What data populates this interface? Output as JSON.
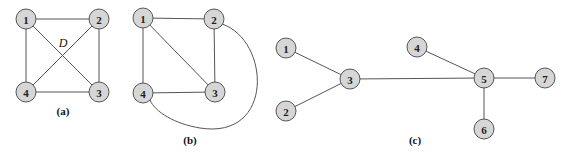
{
  "figure": {
    "node_fill": "#d6d6d6",
    "node_stroke": "#555555",
    "edge_color": "#555555",
    "panels": [
      {
        "id": "a",
        "caption": "(a)",
        "caption_pos": [
          63,
          115
        ],
        "annotation": {
          "text": "D",
          "pos": [
            63,
            47
          ]
        },
        "nodes": [
          {
            "label": "1",
            "x": 26,
            "y": 19
          },
          {
            "label": "2",
            "x": 99,
            "y": 19
          },
          {
            "label": "3",
            "x": 99,
            "y": 92
          },
          {
            "label": "4",
            "x": 26,
            "y": 92
          }
        ],
        "edges": [
          [
            "1",
            "2"
          ],
          [
            "2",
            "3"
          ],
          [
            "3",
            "4"
          ],
          [
            "4",
            "1"
          ],
          [
            "1",
            "3"
          ],
          [
            "2",
            "4"
          ]
        ]
      },
      {
        "id": "b",
        "caption": "(b)",
        "caption_pos": [
          190,
          144
        ],
        "nodes": [
          {
            "label": "1",
            "x": 143,
            "y": 18
          },
          {
            "label": "2",
            "x": 214,
            "y": 19
          },
          {
            "label": "3",
            "x": 215,
            "y": 92
          },
          {
            "label": "4",
            "x": 143,
            "y": 93
          }
        ],
        "edges": [
          [
            "1",
            "2"
          ],
          [
            "2",
            "3"
          ],
          [
            "3",
            "4"
          ],
          [
            "4",
            "1"
          ],
          [
            "1",
            "3"
          ]
        ],
        "curved_edges": [
          {
            "from": "2",
            "to": "4",
            "path": "M 222 24 C 270 40, 275 140, 200 128 C 175 124, 155 112, 150 100"
          }
        ]
      },
      {
        "id": "c",
        "caption": "(c)",
        "caption_pos": [
          415,
          144
        ],
        "nodes": [
          {
            "label": "1",
            "x": 286,
            "y": 48
          },
          {
            "label": "2",
            "x": 286,
            "y": 111
          },
          {
            "label": "3",
            "x": 350,
            "y": 79
          },
          {
            "label": "4",
            "x": 417,
            "y": 47
          },
          {
            "label": "5",
            "x": 484,
            "y": 78
          },
          {
            "label": "6",
            "x": 484,
            "y": 129
          },
          {
            "label": "7",
            "x": 545,
            "y": 78
          }
        ],
        "edges": [
          [
            "1",
            "3"
          ],
          [
            "2",
            "3"
          ],
          [
            "3",
            "5"
          ],
          [
            "4",
            "5"
          ],
          [
            "5",
            "7"
          ],
          [
            "5",
            "6"
          ]
        ]
      }
    ]
  }
}
